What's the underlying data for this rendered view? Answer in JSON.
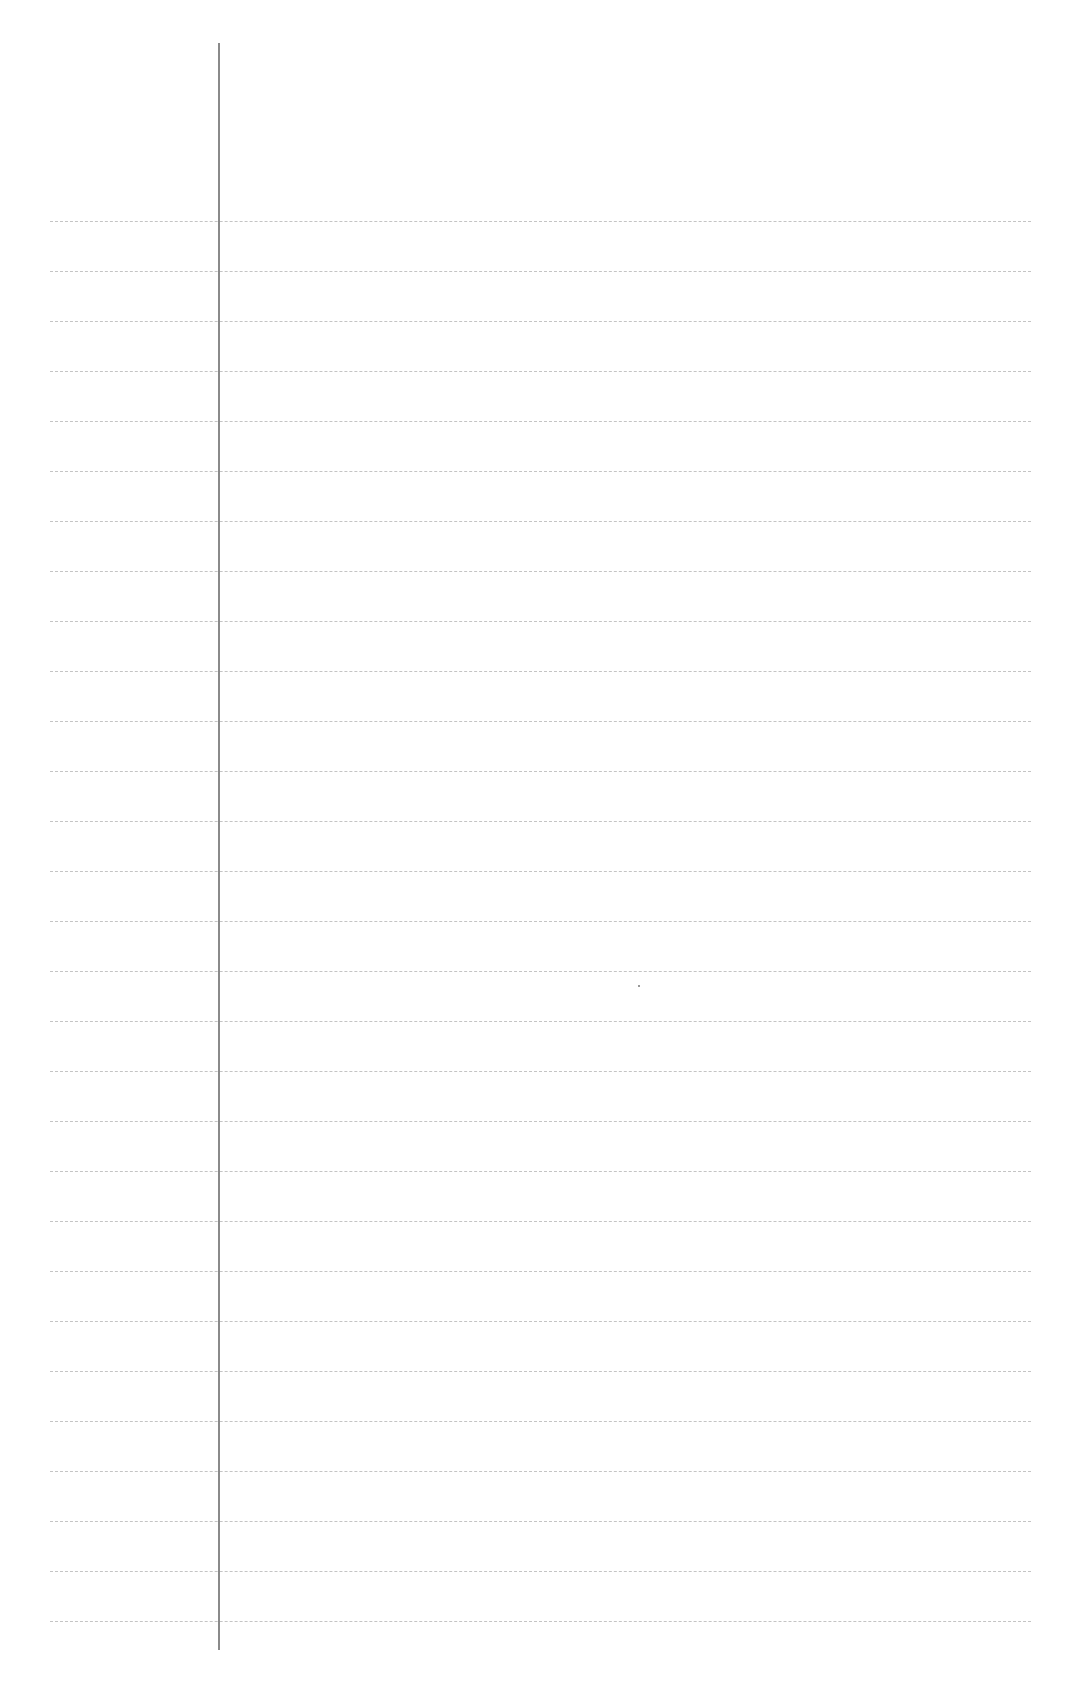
{
  "page": {
    "type": "lined-paper",
    "background_color": "#ffffff",
    "rule_color": "#c4c4c4",
    "margin_line_color": "#8a8a8a",
    "rules": {
      "count": 29,
      "first_y": 221,
      "spacing": 50,
      "left_x": 50,
      "right_x": 1031
    },
    "margin_line": {
      "x": 218,
      "top_y": 43,
      "bottom_y": 1650
    },
    "text_lines": []
  }
}
